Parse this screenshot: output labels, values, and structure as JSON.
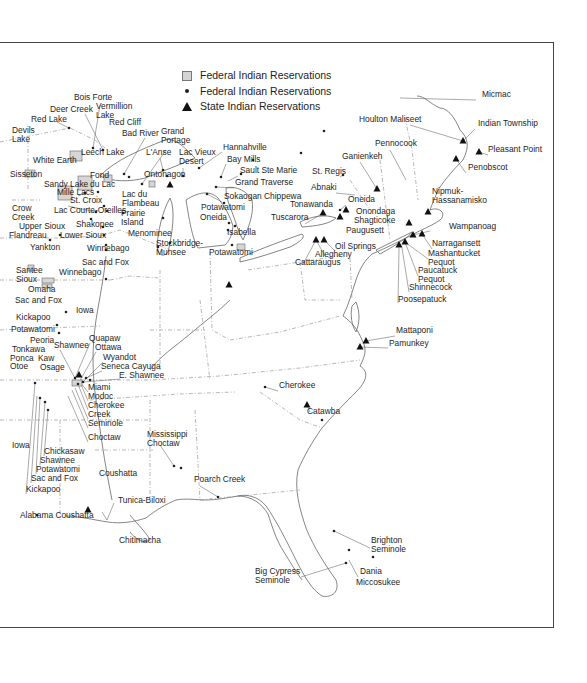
{
  "legend": {
    "federal_land": {
      "label": "Federal Indian Reservations",
      "symbol": "gray-square"
    },
    "federal_point": {
      "label": "Federal Indian Reservations",
      "symbol": "dot"
    },
    "state": {
      "label": "State Indian Reservations",
      "symbol": "triangle"
    }
  },
  "labels": [
    {
      "text": "Bois Forte",
      "x": 74,
      "y": 100
    },
    {
      "text": "Deer Creek",
      "x": 50,
      "y": 112
    },
    {
      "text": "Vermillion\nLake",
      "x": 96,
      "y": 109
    },
    {
      "text": "Red Lake",
      "x": 31,
      "y": 122
    },
    {
      "text": "Red Cliff",
      "x": 109,
      "y": 125
    },
    {
      "text": "Devils\nLake",
      "x": 12,
      "y": 133
    },
    {
      "text": "Bad River",
      "x": 122,
      "y": 136
    },
    {
      "text": "Grand\nPortage",
      "x": 161,
      "y": 134
    },
    {
      "text": "Leech Lake",
      "x": 81,
      "y": 155
    },
    {
      "text": "L'Anse",
      "x": 146,
      "y": 155
    },
    {
      "text": "Lac Vieux\nDesert",
      "x": 179,
      "y": 155
    },
    {
      "text": "Hannahville",
      "x": 223,
      "y": 150
    },
    {
      "text": "Bay Mills",
      "x": 227,
      "y": 162
    },
    {
      "text": "Sault Ste Marie",
      "x": 240,
      "y": 173
    },
    {
      "text": "White Earth",
      "x": 33,
      "y": 163
    },
    {
      "text": "Sisseton",
      "x": 10,
      "y": 177
    },
    {
      "text": "Fond\ndu Lac",
      "x": 90,
      "y": 178
    },
    {
      "text": "Ontonagon",
      "x": 144,
      "y": 177
    },
    {
      "text": "Grand Traverse",
      "x": 235,
      "y": 185
    },
    {
      "text": "Sandy Lake",
      "x": 44,
      "y": 187
    },
    {
      "text": "Mille Lacs",
      "x": 57,
      "y": 195
    },
    {
      "text": "Sokaogan Chippewa",
      "x": 224,
      "y": 199
    },
    {
      "text": "Lac du\nFlambeau",
      "x": 122,
      "y": 197
    },
    {
      "text": "St. Croix",
      "x": 70,
      "y": 203
    },
    {
      "text": "Potawatomi",
      "x": 201,
      "y": 210
    },
    {
      "text": "Crow\nCreek",
      "x": 12,
      "y": 211
    },
    {
      "text": "Lac Courte-Oreilles",
      "x": 54,
      "y": 213
    },
    {
      "text": "Prairie\nIsland",
      "x": 121,
      "y": 216
    },
    {
      "text": "Oneida",
      "x": 200,
      "y": 220
    },
    {
      "text": "Upper Sioux",
      "x": 19,
      "y": 229
    },
    {
      "text": "Shakopee",
      "x": 76,
      "y": 227
    },
    {
      "text": "Flandreau",
      "x": 9,
      "y": 238
    },
    {
      "text": "Lower Sioux",
      "x": 60,
      "y": 238
    },
    {
      "text": "Menominee",
      "x": 128,
      "y": 236
    },
    {
      "text": "Isabella",
      "x": 227,
      "y": 235
    },
    {
      "text": "Stockbridge-\nMunsee",
      "x": 156,
      "y": 246
    },
    {
      "text": "Yankton",
      "x": 30,
      "y": 250
    },
    {
      "text": "Winnebago",
      "x": 87,
      "y": 251
    },
    {
      "text": "Potawatomi",
      "x": 209,
      "y": 255
    },
    {
      "text": "Sac and Fox",
      "x": 82,
      "y": 265
    },
    {
      "text": "Santee\nSioux",
      "x": 16,
      "y": 273
    },
    {
      "text": "Winnebago",
      "x": 59,
      "y": 275
    },
    {
      "text": "Omaha",
      "x": 28,
      "y": 292
    },
    {
      "text": "Sac and Fox",
      "x": 15,
      "y": 303
    },
    {
      "text": "Iowa",
      "x": 76,
      "y": 313
    },
    {
      "text": "Kickapoo",
      "x": 16,
      "y": 320
    },
    {
      "text": "Potawatomi",
      "x": 11,
      "y": 332
    },
    {
      "text": "Quapaw",
      "x": 89,
      "y": 341
    },
    {
      "text": "Peoria",
      "x": 30,
      "y": 343
    },
    {
      "text": "Shawnee",
      "x": 54,
      "y": 348
    },
    {
      "text": "Ottawa",
      "x": 95,
      "y": 350
    },
    {
      "text": "Tonkawa",
      "x": 12,
      "y": 352
    },
    {
      "text": "Wyandot",
      "x": 103,
      "y": 360
    },
    {
      "text": "Ponca",
      "x": 10,
      "y": 361
    },
    {
      "text": "Kaw",
      "x": 38,
      "y": 361
    },
    {
      "text": "Otoe",
      "x": 10,
      "y": 369
    },
    {
      "text": "Osage",
      "x": 40,
      "y": 370
    },
    {
      "text": "Seneca Cayuga",
      "x": 101,
      "y": 369
    },
    {
      "text": "E. Shawnee",
      "x": 119,
      "y": 378
    },
    {
      "text": "Miami",
      "x": 88,
      "y": 390
    },
    {
      "text": "Modoc",
      "x": 88,
      "y": 399
    },
    {
      "text": "Cherokee",
      "x": 88,
      "y": 408
    },
    {
      "text": "Creek",
      "x": 88,
      "y": 417
    },
    {
      "text": "Seminole",
      "x": 88,
      "y": 426
    },
    {
      "text": "Choctaw",
      "x": 88,
      "y": 440
    },
    {
      "text": "Iowa",
      "x": 12,
      "y": 448
    },
    {
      "text": "Chickasaw",
      "x": 44,
      "y": 454
    },
    {
      "text": "Shawnee",
      "x": 40,
      "y": 463
    },
    {
      "text": "Potawatomi",
      "x": 36,
      "y": 472
    },
    {
      "text": "Sac and Fox",
      "x": 31,
      "y": 481
    },
    {
      "text": "Kickapoo",
      "x": 26,
      "y": 492
    },
    {
      "text": "Mississippi\nChoctaw",
      "x": 147,
      "y": 437
    },
    {
      "text": "Coushatta",
      "x": 99,
      "y": 476
    },
    {
      "text": "Poarch Creek",
      "x": 194,
      "y": 482
    },
    {
      "text": "Tunica-Biloxi",
      "x": 118,
      "y": 503
    },
    {
      "text": "Alabama Coushatta",
      "x": 20,
      "y": 518
    },
    {
      "text": "Chitimacha",
      "x": 119,
      "y": 543
    },
    {
      "text": "Micmac",
      "x": 482,
      "y": 97
    },
    {
      "text": "Houlton Maliseet",
      "x": 359,
      "y": 122
    },
    {
      "text": "Indian Township",
      "x": 478,
      "y": 126
    },
    {
      "text": "Pennocook",
      "x": 375,
      "y": 146
    },
    {
      "text": "Pleasant Point",
      "x": 488,
      "y": 152
    },
    {
      "text": "Ganienkeh",
      "x": 342,
      "y": 159
    },
    {
      "text": "Penobscot",
      "x": 468,
      "y": 170
    },
    {
      "text": "St. Regis",
      "x": 312,
      "y": 174
    },
    {
      "text": "Abnaki",
      "x": 311,
      "y": 190
    },
    {
      "text": "Oneida",
      "x": 348,
      "y": 202
    },
    {
      "text": "Nipmuk-\nHassanamisko",
      "x": 432,
      "y": 194
    },
    {
      "text": "Tonawanda",
      "x": 290,
      "y": 207
    },
    {
      "text": "Onondaga",
      "x": 356,
      "y": 214
    },
    {
      "text": "Wampanoag",
      "x": 449,
      "y": 229
    },
    {
      "text": "Tuscarora",
      "x": 271,
      "y": 220
    },
    {
      "text": "Shagticoke",
      "x": 354,
      "y": 223
    },
    {
      "text": "Paugusett",
      "x": 346,
      "y": 233
    },
    {
      "text": "Narragansett",
      "x": 432,
      "y": 246
    },
    {
      "text": "Oil Springs",
      "x": 335,
      "y": 249
    },
    {
      "text": "Mashantucket\nPequot",
      "x": 428,
      "y": 256
    },
    {
      "text": "Allegheny",
      "x": 315,
      "y": 257
    },
    {
      "text": "Cattaraugus",
      "x": 295,
      "y": 265
    },
    {
      "text": "Paucatuck\nPequot",
      "x": 418,
      "y": 273
    },
    {
      "text": "Shinnecock",
      "x": 409,
      "y": 290
    },
    {
      "text": "Poosepatuck",
      "x": 398,
      "y": 302
    },
    {
      "text": "Mattaponi",
      "x": 396,
      "y": 333
    },
    {
      "text": "Pamunkey",
      "x": 389,
      "y": 346
    },
    {
      "text": "Cherokee",
      "x": 279,
      "y": 388
    },
    {
      "text": "Catawba",
      "x": 307,
      "y": 414
    },
    {
      "text": "Brighton\nSeminole",
      "x": 371,
      "y": 543
    },
    {
      "text": "Dania",
      "x": 360,
      "y": 574
    },
    {
      "text": "Big Cypress\nSeminole",
      "x": 255,
      "y": 574
    },
    {
      "text": "Miccosukee",
      "x": 356,
      "y": 585
    }
  ],
  "state_markers": [
    [
      463,
      141
    ],
    [
      479,
      152
    ],
    [
      456,
      159
    ],
    [
      377,
      189
    ],
    [
      346,
      210
    ],
    [
      340,
      217
    ],
    [
      323,
      213
    ],
    [
      324,
      240
    ],
    [
      316,
      240
    ],
    [
      409,
      223
    ],
    [
      428,
      212
    ],
    [
      413,
      235
    ],
    [
      422,
      234
    ],
    [
      399,
      245
    ],
    [
      405,
      242
    ],
    [
      170,
      185
    ],
    [
      229,
      285
    ],
    [
      79,
      375
    ],
    [
      366,
      341
    ],
    [
      360,
      347
    ],
    [
      307,
      405
    ],
    [
      88,
      510
    ]
  ],
  "federal_points": [
    [
      69,
      128
    ],
    [
      93,
      148
    ],
    [
      103,
      150
    ],
    [
      124,
      174
    ],
    [
      129,
      177
    ],
    [
      142,
      184
    ],
    [
      163,
      170
    ],
    [
      167,
      176
    ],
    [
      183,
      176
    ],
    [
      199,
      168
    ],
    [
      221,
      177
    ],
    [
      216,
      187
    ],
    [
      207,
      194
    ],
    [
      224,
      203
    ],
    [
      229,
      223
    ],
    [
      85,
      193
    ],
    [
      98,
      192
    ],
    [
      104,
      206
    ],
    [
      107,
      211
    ],
    [
      96,
      212
    ],
    [
      50,
      240
    ],
    [
      60,
      235
    ],
    [
      91,
      219
    ],
    [
      103,
      227
    ],
    [
      104,
      235
    ],
    [
      106,
      245
    ],
    [
      106,
      250
    ],
    [
      123,
      213
    ],
    [
      158,
      247
    ],
    [
      170,
      243
    ],
    [
      163,
      218
    ],
    [
      106,
      279
    ],
    [
      66,
      312
    ],
    [
      57,
      325
    ],
    [
      59,
      333
    ],
    [
      35,
      383
    ],
    [
      40,
      398
    ],
    [
      45,
      402
    ],
    [
      48,
      410
    ],
    [
      75,
      378
    ],
    [
      78,
      384
    ],
    [
      83,
      382
    ],
    [
      86,
      378
    ],
    [
      90,
      380
    ],
    [
      37,
      515
    ],
    [
      174,
      466
    ],
    [
      181,
      468
    ],
    [
      218,
      497
    ],
    [
      322,
      420
    ],
    [
      334,
      531
    ],
    [
      349,
      550
    ],
    [
      373,
      557
    ],
    [
      346,
      563
    ],
    [
      301,
      153
    ],
    [
      324,
      131
    ],
    [
      340,
      210
    ],
    [
      343,
      175
    ],
    [
      265,
      387
    ],
    [
      232,
      245
    ],
    [
      235,
      226
    ],
    [
      228,
      230
    ],
    [
      241,
      174
    ],
    [
      253,
      160
    ]
  ],
  "federal_land": [
    [
      25,
      170,
      10,
      7
    ],
    [
      70,
      151,
      12,
      10
    ],
    [
      58,
      186,
      14,
      14
    ],
    [
      78,
      176,
      14,
      14
    ],
    [
      104,
      175,
      8,
      7
    ],
    [
      149,
      181,
      6,
      6
    ],
    [
      28,
      265,
      6,
      6
    ],
    [
      42,
      278,
      12,
      5
    ],
    [
      42,
      284,
      10,
      4
    ],
    [
      72,
      380,
      10,
      6
    ],
    [
      237,
      244,
      8,
      6
    ]
  ]
}
